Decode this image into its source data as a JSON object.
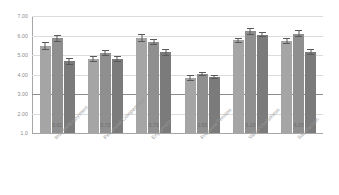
{
  "chart_data": {
    "type": "bar",
    "title": "",
    "subtitle": "",
    "xlabel": "",
    "ylabel": "",
    "ylim": [
      1.0,
      7.0
    ],
    "grid": true,
    "legend_position": "none",
    "orientation": "vertical",
    "categories": [
      "Interest/Enjoyment",
      "Perceived Competence",
      "Enjoyment",
      "Pressure/Tension",
      "Value/Usefulness",
      "Satisfaction"
    ],
    "ytick_labels": [
      "7.00",
      "6.00",
      "5.00",
      "4.00",
      "3.00",
      "2.00",
      "1.0"
    ],
    "ytick_values": [
      7.0,
      6.0,
      5.0,
      4.0,
      3.0,
      2.0,
      1.0
    ],
    "emphasis_gridline": 3.0,
    "series": [
      {
        "name": "Series 1",
        "color": "#a5a5a5",
        "values": [
          5.45,
          4.8,
          5.88,
          3.82,
          5.75,
          5.72
        ],
        "errors": [
          0.2,
          0.14,
          0.22,
          0.14,
          0.14,
          0.16
        ]
      },
      {
        "name": "Series 2",
        "color": "#8f8f8f",
        "values": [
          5.86,
          5.1,
          5.65,
          4.03,
          6.22,
          6.1
        ],
        "errors": [
          0.17,
          0.16,
          0.16,
          0.11,
          0.18,
          0.18
        ]
      },
      {
        "name": "Series 3",
        "color": "#7b7b7b",
        "values": [
          4.68,
          4.8,
          5.13,
          3.88,
          6.05,
          5.15
        ],
        "errors": [
          0.17,
          0.15,
          0.17,
          0.11,
          0.15,
          0.16
        ]
      }
    ],
    "group_labels": [
      "5.61",
      "5.73",
      "5.79",
      "3.65",
      "6.23",
      "6.05"
    ]
  }
}
